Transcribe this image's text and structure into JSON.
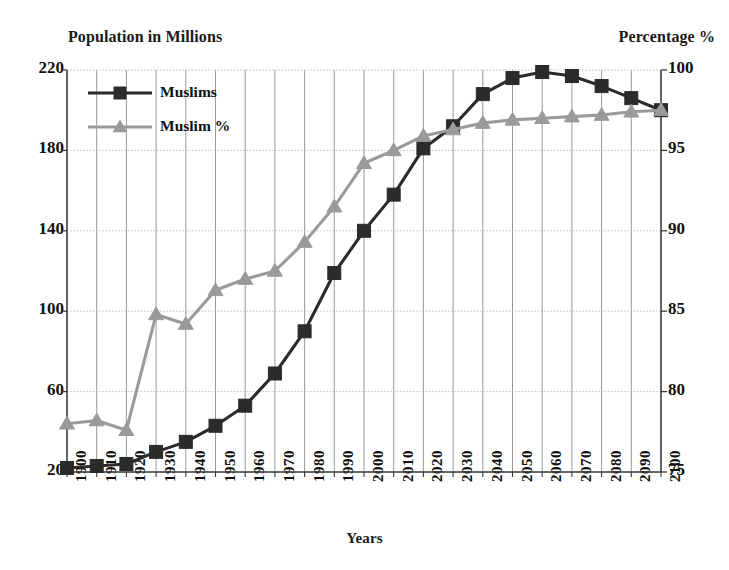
{
  "chart_data": {
    "type": "line",
    "title": "",
    "xlabel": "Years",
    "ylabel": "Population in Millions",
    "y2label": "Percentage %",
    "grid": true,
    "legend_position": "top-left",
    "categories": [
      "1900",
      "1910",
      "1920",
      "1930",
      "1940",
      "1950",
      "1960",
      "1970",
      "1980",
      "1990",
      "2000",
      "2010",
      "2020",
      "2030",
      "2040",
      "2050",
      "2060",
      "2070",
      "2080",
      "2090",
      "2100"
    ],
    "ylim": [
      20,
      220
    ],
    "yticks": [
      "20",
      "60",
      "100",
      "140",
      "180",
      "220"
    ],
    "y2lim": [
      75,
      100
    ],
    "y2ticks": [
      "75",
      "80",
      "85",
      "90",
      "95",
      "100"
    ],
    "series": [
      {
        "name": "Muslims",
        "axis": "left",
        "color": "#2b2b2b",
        "marker": "square",
        "values": [
          22,
          23,
          24,
          30,
          35,
          43,
          53,
          69,
          90,
          119,
          140,
          158,
          181,
          192,
          208,
          216,
          219,
          217,
          212,
          206,
          200
        ]
      },
      {
        "name": "Muslim %",
        "axis": "right",
        "color": "#9a9a9a",
        "marker": "triangle",
        "values": [
          78.0,
          78.2,
          77.6,
          84.8,
          84.2,
          86.3,
          87.0,
          87.5,
          89.3,
          91.5,
          94.2,
          95.0,
          95.9,
          96.3,
          96.7,
          96.9,
          97.0,
          97.1,
          97.2,
          97.4,
          97.5
        ]
      }
    ]
  },
  "legend": {
    "items": [
      {
        "label": "Muslims"
      },
      {
        "label": "Muslim %"
      }
    ]
  }
}
